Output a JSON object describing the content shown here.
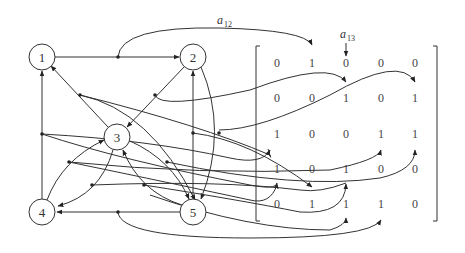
{
  "diagram": {
    "type": "directed-graph-with-adjacency-matrix",
    "nodes": [
      {
        "id": "1",
        "label": "1"
      },
      {
        "id": "2",
        "label": "2"
      },
      {
        "id": "3",
        "label": "3"
      },
      {
        "id": "4",
        "label": "4"
      },
      {
        "id": "5",
        "label": "5"
      }
    ],
    "edges": [
      {
        "from": "1",
        "to": "2"
      },
      {
        "from": "2",
        "to": "3"
      },
      {
        "from": "3",
        "to": "1"
      },
      {
        "from": "3",
        "to": "4"
      },
      {
        "from": "3",
        "to": "5"
      },
      {
        "from": "4",
        "to": "1"
      },
      {
        "from": "4",
        "to": "3"
      },
      {
        "from": "5",
        "to": "2"
      },
      {
        "from": "5",
        "to": "3"
      },
      {
        "from": "5",
        "to": "4"
      },
      {
        "from": "2",
        "to": "5"
      },
      {
        "from": "1",
        "to": "5"
      }
    ],
    "annotations": {
      "a12": {
        "base": "a",
        "sub": "12"
      },
      "a13": {
        "base": "a",
        "sub": "13"
      }
    },
    "matrix": {
      "rows": [
        [
          "0",
          "1",
          "0",
          "0",
          "0"
        ],
        [
          "0",
          "0",
          "1",
          "0",
          "1"
        ],
        [
          "1",
          "0",
          "0",
          "1",
          "1"
        ],
        [
          "1",
          "0",
          "1",
          "0",
          "0"
        ],
        [
          "0",
          "1",
          "1",
          "1",
          "0"
        ]
      ]
    }
  }
}
